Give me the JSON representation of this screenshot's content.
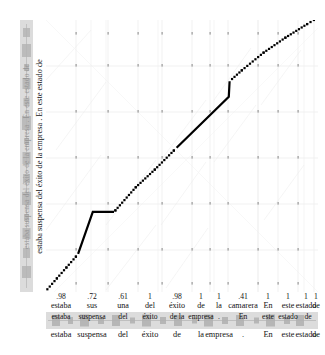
{
  "figure": {
    "type": "dtw-alignment-path-plot",
    "accent_color": "#000000",
    "strip_color": "#dcdcdc",
    "grid_color": "#e8e8e8"
  },
  "y_axis": {
    "label": "estaba suspensa del éxito de la empresa .  En este estado de",
    "waveform_label": "estaba suspensa del éxito de la empresa . En este estado de"
  },
  "x_axis": {
    "scores": [
      ".98",
      ".72",
      ".61",
      "1",
      ".98",
      "1",
      "1",
      ".41",
      "1",
      "1",
      "1",
      "1"
    ],
    "words": [
      "estaba",
      "sus",
      "una",
      "del",
      "éxito",
      "de",
      "la",
      "camarera",
      "En",
      "este",
      "estado",
      "de"
    ],
    "bottom_words": [
      "estaba",
      "suspensa",
      "del",
      "éxito",
      "de",
      "la",
      "empresa",
      ".",
      "En",
      "este",
      "estado",
      "de"
    ],
    "waveform_words": [
      "estaba",
      "suspensa",
      "del",
      "éxito",
      "de la",
      "empresa",
      ".",
      "En",
      "este",
      "estado",
      "de"
    ]
  },
  "chart_data": {
    "type": "line",
    "title": "",
    "xlabel": "estaba suspensa del éxito de la empresa . En este estado de",
    "ylabel": "estaba suspensa del éxito de la empresa . En este estado de",
    "xlim": [
      0,
      1
    ],
    "ylim": [
      0,
      1
    ],
    "grid": true,
    "legend": "none",
    "series": [
      {
        "name": "alignment-path",
        "style": "dotted-with-solid-deviations",
        "points": [
          [
            0.005,
            0.01
          ],
          [
            0.04,
            0.05
          ],
          [
            0.075,
            0.09
          ],
          [
            0.11,
            0.13
          ],
          [
            0.118,
            0.14
          ],
          [
            0.17,
            0.205
          ],
          [
            0.172,
            0.295
          ],
          [
            0.25,
            0.295
          ],
          [
            0.255,
            0.3
          ],
          [
            0.33,
            0.385
          ],
          [
            0.4,
            0.45
          ],
          [
            0.47,
            0.52
          ],
          [
            0.48,
            0.53
          ],
          [
            0.56,
            0.62
          ],
          [
            0.64,
            0.69
          ],
          [
            0.672,
            0.718
          ],
          [
            0.675,
            0.775
          ],
          [
            0.72,
            0.815
          ],
          [
            0.8,
            0.88
          ],
          [
            0.88,
            0.935
          ],
          [
            0.96,
            0.985
          ],
          [
            0.985,
            1.0
          ]
        ],
        "solid_segments": [
          [
            [
              0.118,
              0.14
            ],
            [
              0.172,
              0.295
            ],
            [
              0.25,
              0.295
            ]
          ],
          [
            [
              0.48,
              0.53
            ],
            [
              0.672,
              0.718
            ],
            [
              0.675,
              0.775
            ]
          ]
        ]
      }
    ]
  }
}
